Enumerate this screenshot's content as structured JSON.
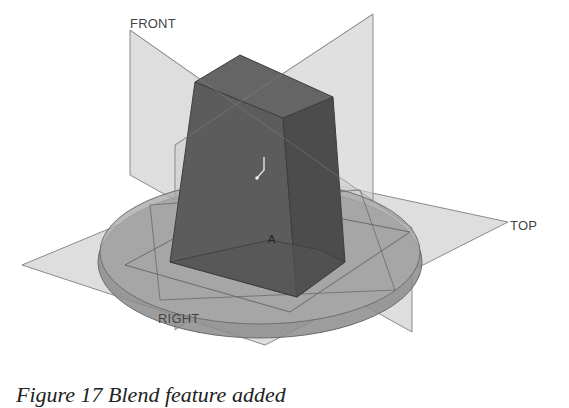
{
  "figure": {
    "caption": "Figure 17 Blend feature added",
    "datum_planes": {
      "front": "FRONT",
      "top": "TOP",
      "right": "RIGHT"
    },
    "coordinate_system_label": "A",
    "colors": {
      "background": "#ffffff",
      "datum_plane_fill": "#d4d4d4",
      "datum_plane_edge": "#8a8a8a",
      "disc_top": "#a8a8a8",
      "disc_side": "#8c8c8c",
      "blend_front": "#5a5a5a",
      "blend_side": "#4a4a4a",
      "blend_top": "#626262",
      "label_text": "#444444"
    }
  }
}
